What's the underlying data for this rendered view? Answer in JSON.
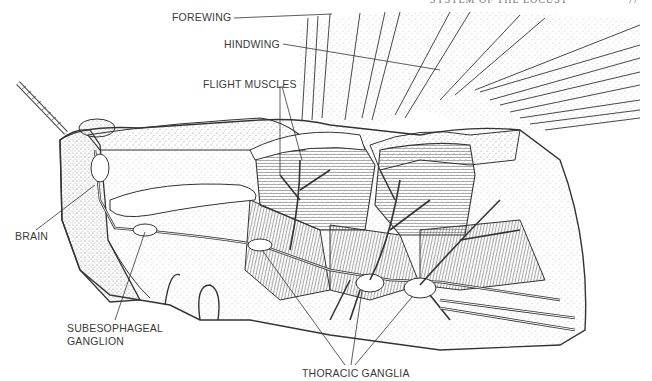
{
  "running_head": {
    "text": "SYSTEM OF THE LOCUST",
    "page_number": "77"
  },
  "figure": {
    "labels": {
      "forewing": "FOREWING",
      "hindwing": "HINDWING",
      "flight_muscles": "FLIGHT MUSCLES",
      "brain": "BRAIN",
      "subesophageal_line1": "SUBESOPHAGEAL",
      "subesophageal_line2": "GANGLION",
      "thoracic_ganglia": "THORACIC GANGLIA"
    },
    "colors": {
      "ink": "#2a2a2a",
      "stipple": "#9a9a9a",
      "background": "#ffffff"
    }
  }
}
